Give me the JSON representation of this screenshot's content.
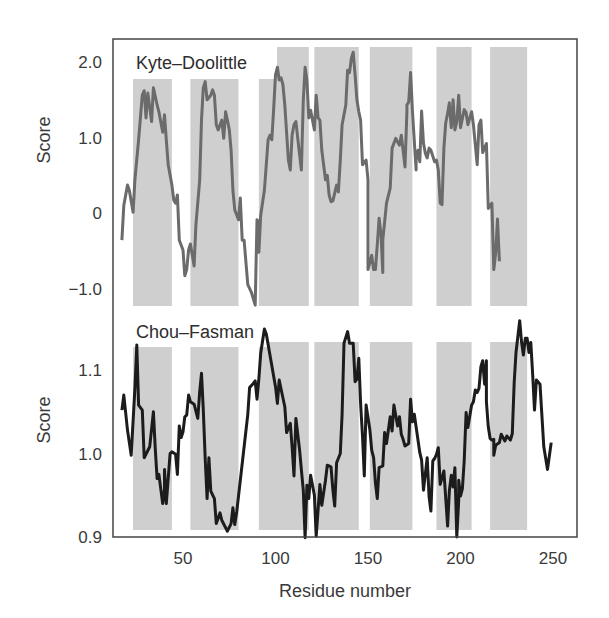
{
  "chart_data": {
    "type": "line",
    "title": "",
    "xlabel": "Residue number",
    "xlim": [
      12,
      263
    ],
    "xticks": [
      50,
      100,
      150,
      200,
      250
    ],
    "grid": false,
    "shaded_regions": [
      [
        23,
        44
      ],
      [
        54,
        80
      ],
      [
        91,
        118
      ],
      [
        121,
        145
      ],
      [
        151,
        174
      ],
      [
        187,
        206
      ],
      [
        216,
        236
      ]
    ],
    "panels": [
      {
        "name": "Kyte–Doolittle",
        "ylabel": "Score",
        "ylim": [
          -1.3,
          2.3
        ],
        "yticks": [
          2.0,
          1.0,
          0,
          -1.0
        ],
        "ytick_labels": [
          "2.0",
          "1.0",
          "0",
          "−1.0"
        ],
        "color": "#6b6b6b",
        "x": [
          17,
          18,
          20,
          21,
          23,
          24,
          26,
          28,
          29,
          30,
          31,
          33,
          34,
          36,
          37,
          39,
          40,
          41,
          42,
          44,
          45,
          46,
          47,
          48,
          50,
          51,
          52,
          53,
          54,
          56,
          57,
          59,
          60,
          61,
          62,
          63,
          65,
          66,
          67,
          68,
          69,
          71,
          72,
          73,
          74,
          75,
          76,
          77,
          78,
          80,
          81,
          82,
          83,
          85,
          87,
          89,
          90,
          91,
          91,
          92,
          94,
          96,
          97,
          98,
          99,
          100,
          101,
          102,
          103,
          104,
          105,
          107,
          108,
          109,
          110,
          111,
          113,
          114,
          115,
          116,
          117,
          118,
          119,
          121,
          122,
          123,
          124,
          125,
          127,
          128,
          129,
          130,
          131,
          133,
          134,
          135,
          136,
          138,
          139,
          140,
          141,
          142,
          143,
          144,
          145,
          146,
          147,
          149,
          150,
          150,
          152,
          153,
          154,
          155,
          156,
          157,
          158,
          158,
          159,
          160,
          162,
          163,
          165,
          166,
          167,
          168,
          170,
          171,
          171,
          172,
          173,
          174,
          176,
          176,
          177,
          178,
          179,
          180,
          181,
          182,
          183,
          184,
          186,
          187,
          188,
          189,
          190,
          191,
          192,
          193,
          194,
          194,
          195,
          196,
          197,
          198,
          199,
          200,
          202,
          203,
          204,
          206,
          207,
          209,
          210,
          211,
          212,
          214,
          215,
          217,
          218,
          219,
          220,
          221
        ],
        "values": [
          -0.36,
          0.1,
          0.37,
          0.3,
          0.01,
          0.44,
          0.97,
          1.56,
          1.62,
          1.26,
          1.59,
          1.21,
          1.66,
          1.43,
          1.34,
          1.07,
          1.3,
          0.97,
          0.64,
          0.37,
          0.17,
          0.13,
          0.24,
          -0.36,
          -0.49,
          -0.83,
          -0.75,
          -0.49,
          -0.41,
          -0.7,
          -0.16,
          0.44,
          1.23,
          1.66,
          1.74,
          1.5,
          1.56,
          1.63,
          1.56,
          1.17,
          1.1,
          1.23,
          0.99,
          1.34,
          1.23,
          1.1,
          0.83,
          0.3,
          0.04,
          -0.09,
          0.2,
          -0.36,
          -0.36,
          -0.95,
          -1.05,
          -1.22,
          -0.09,
          -0.12,
          -0.52,
          -0.03,
          0.3,
          0.97,
          1.03,
          0.97,
          1.36,
          1.83,
          1.93,
          1.76,
          1.79,
          1.7,
          1.43,
          0.7,
          0.57,
          1.03,
          1.17,
          1.21,
          0.77,
          0.57,
          1.5,
          1.93,
          1.76,
          1.26,
          1.36,
          1.1,
          1.56,
          1.26,
          1.23,
          0.83,
          0.44,
          0.5,
          0.24,
          0.15,
          0.16,
          0.37,
          0.28,
          0.7,
          1.17,
          1.43,
          1.89,
          1.86,
          2.05,
          2.13,
          1.83,
          1.5,
          1.34,
          1.23,
          0.64,
          0.7,
          0.44,
          -0.75,
          -0.56,
          -0.75,
          -0.75,
          -0.42,
          -0.07,
          -0.28,
          -0.79,
          -0.36,
          -0.12,
          0.13,
          0.33,
          0.86,
          0.99,
          0.94,
          0.9,
          1.03,
          0.61,
          1.34,
          1.43,
          1.47,
          1.86,
          1.36,
          0.57,
          0.7,
          0.83,
          0.68,
          1.35,
          0.92,
          0.79,
          0.73,
          0.86,
          0.83,
          0.68,
          0.7,
          0.57,
          0.13,
          0.11,
          0.86,
          1.19,
          1.32,
          1.46,
          1.44,
          1.13,
          1.5,
          1.1,
          1.21,
          1.56,
          1.13,
          1.37,
          1.33,
          1.17,
          1.34,
          1.17,
          0.64,
          1.17,
          1.23,
          0.8,
          0.92,
          0.06,
          0.13,
          -0.75,
          -0.53,
          -0.08,
          -0.64,
          -1.05,
          -0.49,
          -0.53,
          -0.29,
          -0.6
        ],
        "label_box": {
          "x": 125,
          "y": 43,
          "w": 152,
          "h": 36
        }
      },
      {
        "name": "Chou–Fasman",
        "ylabel": "Score",
        "ylim": [
          0.9,
          1.14
        ],
        "yticks": [
          1.1,
          1.0,
          0.9
        ],
        "ytick_labels": [
          "1.1",
          "1.0",
          "0.9"
        ],
        "color": "#1c1c1c",
        "x": [
          17,
          18,
          20,
          22,
          24,
          25,
          26,
          28,
          29,
          32,
          34,
          35,
          36,
          37,
          39,
          40,
          40,
          41,
          43,
          44,
          46,
          47,
          48,
          49,
          50,
          51,
          52,
          53,
          54,
          56,
          58,
          59,
          60,
          61,
          62,
          63,
          64,
          65,
          67,
          68,
          70,
          71,
          74,
          76,
          77,
          78,
          79,
          85,
          86,
          88,
          89,
          90,
          91,
          92,
          94,
          95,
          100,
          101,
          102,
          103,
          105,
          106,
          108,
          109,
          110,
          111,
          113,
          114,
          115,
          116,
          117,
          118,
          119,
          121,
          122,
          124,
          125,
          127,
          128,
          130,
          131,
          132,
          133,
          135,
          136,
          137,
          139,
          140,
          142,
          143,
          144,
          145,
          146,
          147,
          148,
          149,
          151,
          152,
          153,
          154,
          155,
          156,
          158,
          159,
          160,
          162,
          163,
          164,
          166,
          167,
          168,
          169,
          170,
          172,
          173,
          174,
          175,
          178,
          179,
          180,
          182,
          183,
          184,
          185,
          186,
          187,
          188,
          189,
          191,
          193,
          194,
          195,
          196,
          197,
          198,
          199,
          199,
          200,
          201,
          202,
          203,
          204,
          206,
          207,
          208,
          209,
          210,
          211,
          212,
          213,
          214,
          214,
          215,
          216,
          217,
          218,
          218,
          219,
          221,
          222,
          224,
          225,
          227,
          228,
          229,
          230,
          232,
          233,
          234,
          235,
          236,
          237,
          238,
          239,
          240,
          241,
          243,
          245,
          247,
          249,
          250,
          251
        ],
        "values": [
          1.052,
          1.07,
          1.028,
          0.998,
          1.078,
          1.13,
          1.058,
          1.052,
          0.995,
          1.008,
          1.05,
          1.005,
          0.97,
          0.975,
          0.94,
          0.957,
          0.981,
          0.94,
          1.0,
          1.002,
          0.999,
          0.975,
          1.033,
          1.019,
          1.026,
          1.044,
          1.046,
          1.07,
          1.062,
          1.059,
          1.042,
          1.074,
          1.096,
          1.052,
          0.994,
          0.946,
          0.995,
          0.955,
          0.946,
          0.916,
          0.929,
          0.92,
          0.907,
          0.916,
          0.935,
          0.915,
          0.93,
          1.047,
          1.079,
          1.084,
          1.087,
          1.065,
          1.09,
          1.12,
          1.149,
          1.143,
          1.08,
          1.06,
          1.088,
          1.077,
          1.056,
          1.025,
          1.036,
          1.008,
          0.973,
          1.042,
          1.004,
          0.98,
          0.956,
          0.899,
          0.962,
          0.946,
          0.974,
          0.95,
          0.901,
          0.963,
          0.938,
          0.968,
          0.986,
          0.984,
          0.956,
          0.937,
          0.989,
          1.0,
          1.047,
          1.132,
          1.146,
          1.132,
          1.132,
          1.086,
          1.089,
          1.114,
          1.06,
          1.021,
          0.973,
          1.058,
          1.028,
          1.004,
          0.995,
          0.965,
          0.946,
          0.983,
          0.985,
          1.025,
          1.012,
          1.044,
          1.027,
          1.058,
          1.033,
          1.044,
          1.023,
          1.017,
          1.009,
          1.012,
          1.065,
          1.038,
          1.047,
          1.001,
          0.992,
          0.956,
          0.995,
          0.948,
          0.931,
          0.991,
          0.994,
          0.999,
          1.007,
          0.963,
          0.979,
          0.913,
          0.956,
          0.974,
          0.96,
          0.983,
          0.9,
          0.944,
          0.968,
          0.949,
          0.958,
          0.991,
          1.049,
          1.031,
          1.058,
          1.062,
          1.076,
          1.073,
          1.078,
          1.104,
          1.111,
          1.083,
          1.111,
          1.062,
          1.032,
          1.018,
          1.016,
          1.017,
          0.998,
          1.01,
          1.013,
          1.023,
          1.015,
          1.021,
          1.016,
          1.024,
          1.085,
          1.121,
          1.159,
          1.134,
          1.118,
          1.138,
          1.138,
          1.121,
          1.133,
          1.094,
          1.052,
          1.088,
          1.083,
          1.008,
          0.981,
          1.013
        ],
        "label_box": {
          "x": 125,
          "y": 313,
          "w": 144,
          "h": 34
        }
      }
    ]
  },
  "figure": {
    "panel_labels": [
      "Kyte–Doolittle",
      "Chou–Fasman"
    ],
    "y_axis_label": "Score",
    "x_axis_label": "Residue number"
  }
}
